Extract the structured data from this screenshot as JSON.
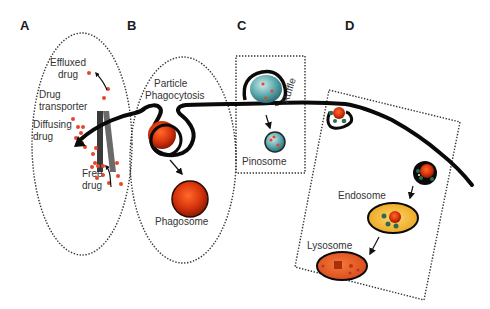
{
  "panels": [
    {
      "id": "A",
      "label": "A",
      "labels": [
        "Effluxed",
        "drug",
        "Drug",
        "transporter",
        "Diffusing",
        "drug",
        "Free",
        "drug"
      ]
    },
    {
      "id": "B",
      "label": "B",
      "labels": [
        "Particle",
        "Phagocytosis",
        "Phagosome"
      ]
    },
    {
      "id": "C",
      "label": "C",
      "labels": [
        "Ruffle",
        "Pinosome"
      ]
    },
    {
      "id": "D",
      "label": "D",
      "labels": [
        "Endosome",
        "Lysosome"
      ]
    }
  ],
  "colors": {
    "drug_dot": "#e8462a",
    "particle": "#d63a10",
    "pinosome": "#4fa6a8",
    "endosome": "#f0b52a",
    "lysosome": "#e85a20",
    "receptor": "#2e6b4f",
    "membrane": "#0a0a0a"
  }
}
